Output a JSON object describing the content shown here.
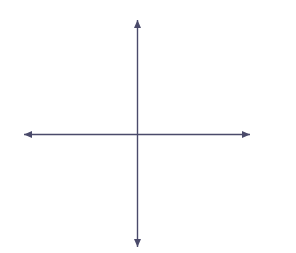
{
  "labels": {
    "y_axis_title": "y-axis",
    "x_axis_title": "x-axis"
  },
  "chart_data": {
    "type": "line",
    "title": "",
    "xlabel": "x-axis",
    "ylabel": "y-axis",
    "xlim": [
      -8,
      8
    ],
    "ylim": [
      -8,
      8
    ],
    "grid": true,
    "grid_step": 1,
    "legend": "none",
    "x_ticks": [
      -8,
      -7,
      -6,
      -5,
      -4,
      -3,
      -2,
      -1,
      0,
      1,
      2,
      3,
      4,
      5,
      6,
      7,
      8
    ],
    "y_ticks": [
      8,
      7,
      6,
      5,
      4,
      3,
      2,
      1,
      0,
      -1,
      -2,
      -3,
      -4,
      -5,
      -6,
      -7,
      -8
    ],
    "x_tick_labels": [
      "-8",
      "-7",
      "-6",
      "-5",
      "-4",
      "-3",
      "-2",
      "-1",
      "0",
      "1",
      "2",
      "3",
      "4",
      "5",
      "6",
      "7",
      "8"
    ],
    "y_tick_labels": [
      "8",
      "7",
      "6",
      "5",
      "4",
      "3",
      "2",
      "1",
      "0",
      "-1",
      "-2",
      "-3",
      "-4",
      "-5",
      "-6",
      "-7",
      "-8"
    ],
    "series": [
      {
        "name": "line",
        "equation": "y = x - 5",
        "slope": 1,
        "intercept": -5,
        "x_intercept": 5,
        "y_intercept": -5,
        "arrows": "both",
        "color": "#000000",
        "points": [
          {
            "x": -3,
            "y": -8
          },
          {
            "x": 0,
            "y": -5
          },
          {
            "x": 5,
            "y": 0
          },
          {
            "x": 8,
            "y": 3
          }
        ]
      }
    ],
    "axis_color": "#4a4a6a",
    "grid_color": "#6e6e6e"
  }
}
